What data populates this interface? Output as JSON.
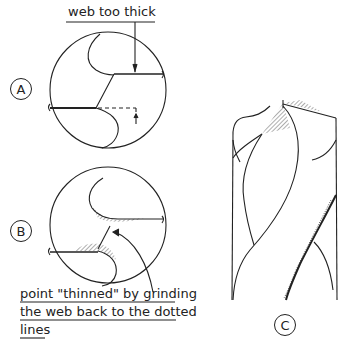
{
  "diagram": {
    "type": "technical-illustration",
    "figures": [
      {
        "id": "A",
        "label": "A",
        "description": "end view of drill point with web too thick"
      },
      {
        "id": "B",
        "label": "B",
        "description": "end view of drill point after thinning, hatched ground areas"
      },
      {
        "id": "C",
        "label": "C",
        "description": "side view of twist drill showing thinned point"
      }
    ],
    "annotations": {
      "a_callout": "web too thick",
      "b_callout_line1": "point \"thinned\" by grinding",
      "b_callout_line2": "the web back to the dotted",
      "b_callout_line3": "lines"
    },
    "colors": {
      "ink": "#222222",
      "background": "#ffffff"
    }
  }
}
